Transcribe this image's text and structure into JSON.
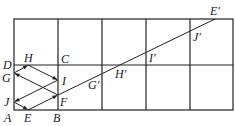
{
  "diagram": {
    "type": "geometry-reflection-grid",
    "grid": {
      "columns": 5,
      "rows": 2,
      "stroke": "#222222"
    },
    "labels": {
      "A": "A",
      "B": "B",
      "C": "C",
      "D": "D",
      "E": "E",
      "F": "F",
      "G": "G",
      "H": "H",
      "I": "I",
      "J": "J",
      "Gp": "G′",
      "Hp": "H′",
      "Ip": "I′",
      "Jp": "J′",
      "Ep": "E′"
    },
    "reflection_path": [
      "E",
      "F",
      "G",
      "H",
      "I",
      "J",
      "E"
    ],
    "unfolded_line": [
      "E",
      "F",
      "G′",
      "H′",
      "I′",
      "J′",
      "E′"
    ]
  }
}
